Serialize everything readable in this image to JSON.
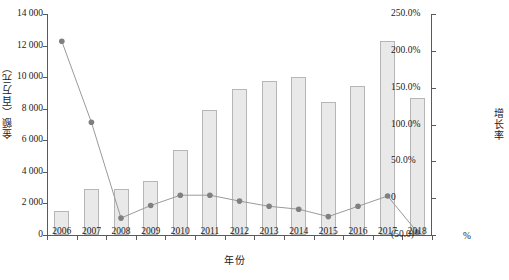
{
  "chart_data": {
    "type": "bar",
    "title": "",
    "subtitle": "",
    "xlabel": "年份",
    "ylabel": "金额（百万元）",
    "y2label": "增长率",
    "y2unit": "%",
    "grid": false,
    "legend": "none",
    "categories": [
      "2006",
      "2007",
      "2008",
      "2009",
      "2010",
      "2011",
      "2012",
      "2013",
      "2014",
      "2015",
      "2016",
      "2017",
      "2018"
    ],
    "ylim": [
      0,
      14000
    ],
    "yticks": [
      0,
      2000,
      4000,
      6000,
      8000,
      10000,
      12000,
      14000
    ],
    "ytick_labels": [
      "0",
      "2 000",
      "4 000",
      "6 000",
      "8 000",
      "10 000",
      "12 000",
      "14 000"
    ],
    "y2lim": [
      -50,
      250
    ],
    "y2ticks": [
      -50,
      0,
      50,
      100,
      150,
      200,
      250
    ],
    "y2tick_labels": [
      "(50.0)",
      "0",
      "50.0%",
      "100.0%",
      "150.0%",
      "200.0%",
      "250.0%"
    ],
    "series": [
      {
        "name": "金额（百万元）",
        "type": "bar",
        "axis": "left",
        "color": "#e9e9e9",
        "border_color": "#b6b6b6",
        "values": [
          1500,
          2900,
          2900,
          3450,
          5400,
          7950,
          9250,
          9750,
          10000,
          8450,
          9450,
          12300,
          8700
        ]
      },
      {
        "name": "增长率",
        "type": "line",
        "axis": "right",
        "color": "#9a9a9a",
        "marker_color": "#808080",
        "values": [
          213.0,
          103.0,
          -27.0,
          -10.0,
          4.0,
          4.0,
          -4.0,
          -11.0,
          -15.0,
          -25.0,
          -11.0,
          3.0,
          -46.0
        ]
      }
    ]
  }
}
